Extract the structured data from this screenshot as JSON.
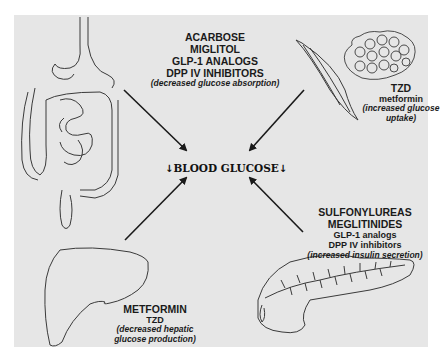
{
  "figure": {
    "center_label": "BLOOD GLUCOSE",
    "center_arrow_left": "↓",
    "center_arrow_right": "↓",
    "colors": {
      "background": "#e6e6e6",
      "ink": "#1a1a1a"
    }
  },
  "organs": {
    "gut": {
      "icon": "intestine-icon",
      "drugs": [
        "ACARBOSE",
        "MIGLITOL",
        "GLP-1 ANALOGS",
        "DPP IV INHIBITORS"
      ],
      "effect": "(decreased glucose absorption)"
    },
    "muscle": {
      "icon": "muscle-fat-icon",
      "drugs_primary": [
        "TZD"
      ],
      "drugs_secondary": [
        "metformin"
      ],
      "effect": "(increased glucose uptake)"
    },
    "pancreas": {
      "icon": "pancreas-icon",
      "drugs_primary": [
        "SULFONYLUREAS",
        "MEGLITINIDES"
      ],
      "drugs_secondary": [
        "GLP-1 analogs",
        "DPP IV inhibitors"
      ],
      "effect": "(increased insulin secretion)"
    },
    "liver": {
      "icon": "liver-icon",
      "drugs_primary": [
        "METFORMIN"
      ],
      "drugs_secondary": [
        "TZD"
      ],
      "effect_line1": "(decreased hepatic",
      "effect_line2": "glucose production)"
    }
  }
}
